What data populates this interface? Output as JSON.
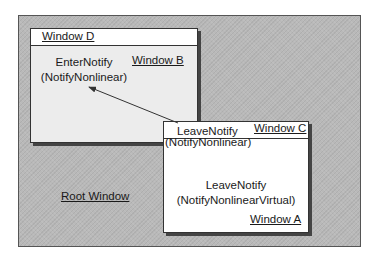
{
  "diagram": {
    "root_window": {
      "label": "Root Window"
    },
    "window_b": {
      "label": "Window B",
      "event": "EnterNotify",
      "detail": "(NotifyNonlinear)"
    },
    "window_d": {
      "label": "Window D"
    },
    "window_a": {
      "label": "Window A",
      "event": "LeaveNotify",
      "detail": "(NotifyNonlinearVirtual)"
    },
    "window_c": {
      "label": "Window C",
      "event": "LeaveNotify",
      "detail": "(NotifyNonlinear)"
    },
    "arrow": {
      "from": "Window C",
      "to": "Window B",
      "direction": "pointer moves from C to B"
    },
    "colors": {
      "root_fill": "#b9b9b9",
      "window_b_fill": "#ececec",
      "window_fill": "#ffffff",
      "stroke": "#333333"
    }
  }
}
